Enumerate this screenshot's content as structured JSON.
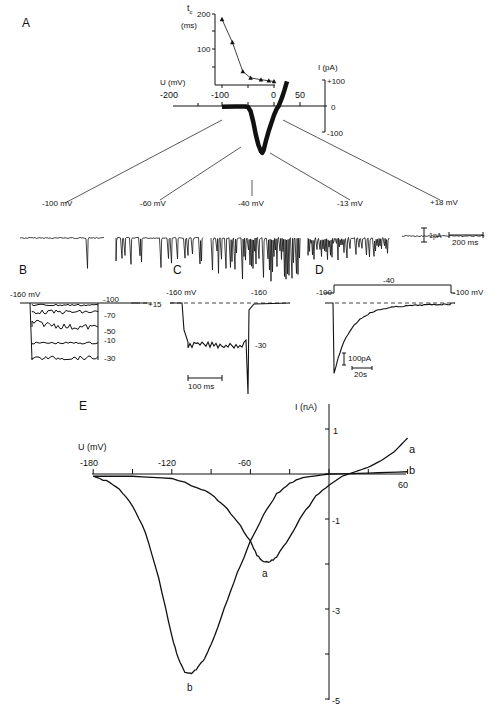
{
  "panels": {
    "A": {
      "label": "A"
    },
    "B": {
      "label": "B"
    },
    "C": {
      "label": "C"
    },
    "D": {
      "label": "D"
    },
    "E": {
      "label": "E"
    }
  },
  "chart_data": [
    {
      "id": "A-main",
      "type": "line",
      "title": "",
      "xlabel": "U (mV)",
      "ylabel": "I (pA)",
      "x_ticks": [
        "-200",
        "-100",
        "0",
        "50"
      ],
      "y_ticks": [
        "+100",
        "0",
        "-100"
      ],
      "xlim": [
        -200,
        60
      ],
      "ylim": [
        -100,
        100
      ],
      "series": [
        {
          "name": "single-channel I-V",
          "x": [
            -200,
            -150,
            -110,
            -100,
            -90,
            -80,
            -70,
            -60,
            -50,
            -45,
            -40,
            -35,
            -30,
            -20,
            -10,
            0,
            10,
            18,
            30,
            40,
            50
          ],
          "y": [
            -3,
            -2,
            -2,
            -4,
            -20,
            -60,
            -110,
            -150,
            -175,
            -180,
            -170,
            -150,
            -130,
            -95,
            -65,
            -35,
            -12,
            0,
            30,
            60,
            95
          ]
        }
      ]
    },
    {
      "id": "A-inset",
      "type": "line",
      "xlabel": "",
      "ylabel": "t_c (ms)",
      "y_ticks": [
        "200",
        "100"
      ],
      "xlim": [
        -110,
        0
      ],
      "ylim": [
        0,
        200
      ],
      "series": [
        {
          "name": "t_c",
          "x": [
            -100,
            -80,
            -60,
            -45,
            -25,
            -10,
            0
          ],
          "y": [
            185,
            120,
            38,
            20,
            15,
            12,
            10
          ]
        }
      ]
    },
    {
      "id": "A-traces",
      "type": "line",
      "traces": [
        "-100 mV",
        "-60 mV",
        "-40 mV",
        "-13 mV",
        "+18 mV"
      ],
      "scalebars": {
        "current": "1pA",
        "time": "200 ms"
      }
    },
    {
      "id": "B",
      "type": "line",
      "holding": "-160 mV",
      "trace_labels": [
        "-100",
        "-70",
        "-50",
        "-10",
        "-30",
        "+15"
      ]
    },
    {
      "id": "C",
      "type": "line",
      "labels": [
        "-160 mV",
        "-160",
        "-30"
      ],
      "scalebar": "100 ms"
    },
    {
      "id": "D",
      "type": "line",
      "protocol": [
        "-100",
        "-40",
        "-100 mV"
      ],
      "scalebars": {
        "current": "100pA",
        "time": "20s"
      }
    },
    {
      "id": "E",
      "type": "line",
      "xlabel": "U (mV)",
      "ylabel": "I (nA)",
      "x_ticks": [
        "-180",
        "-120",
        "-60",
        "60"
      ],
      "y_ticks": [
        "1",
        "-1",
        "-3",
        "-5"
      ],
      "xlim": [
        -180,
        60
      ],
      "ylim": [
        -5,
        1
      ],
      "series": [
        {
          "name": "a",
          "x": [
            -180,
            -150,
            -120,
            -100,
            -90,
            -80,
            -70,
            -60,
            -55,
            -50,
            -45,
            -40,
            -30,
            -20,
            -10,
            0,
            10,
            20,
            30,
            40,
            50,
            60
          ],
          "y": [
            -0.05,
            -0.05,
            -0.1,
            -0.3,
            -0.45,
            -0.7,
            -1.05,
            -1.5,
            -1.8,
            -1.95,
            -1.95,
            -1.85,
            -1.4,
            -0.9,
            -0.5,
            -0.25,
            -0.05,
            0.05,
            0.15,
            0.3,
            0.5,
            0.8
          ]
        },
        {
          "name": "b",
          "x": [
            -180,
            -170,
            -160,
            -150,
            -140,
            -130,
            -120,
            -115,
            -110,
            -105,
            -100,
            -95,
            -90,
            -80,
            -70,
            -60,
            -50,
            -40,
            -30,
            -20,
            0,
            30,
            60
          ],
          "y": [
            -0.05,
            -0.15,
            -0.35,
            -0.7,
            -1.3,
            -2.3,
            -3.6,
            -4.1,
            -4.4,
            -4.45,
            -4.3,
            -4.1,
            -3.8,
            -3.0,
            -2.2,
            -1.5,
            -0.9,
            -0.45,
            -0.2,
            -0.08,
            0,
            0.02,
            0.05
          ]
        }
      ]
    }
  ],
  "labels": {
    "A_tc": "t",
    "A_tc_sub": "c",
    "A_ms": "(ms)",
    "A_inset_200": "200",
    "A_inset_100": "100",
    "A_U": "U (mV)",
    "A_I": "I (pA)",
    "A_xm200": "-200",
    "A_xm100": "-100",
    "A_x0": "0",
    "A_x50": "50",
    "A_yp100": "+100",
    "A_y0": "0",
    "A_ym100": "-100",
    "tr1": "-100 mV",
    "tr2": "-60 mV",
    "tr3": "-40 mV",
    "tr4": "-13 mV",
    "tr5": "+18 mV",
    "sb_pA": "1pA",
    "sb_ms": "200 ms",
    "B_hold": "-160 mV",
    "B_m100": "-100",
    "B_p15": "+15",
    "B_m70": "-70",
    "B_m50": "-50",
    "B_m10": "-10",
    "B_m30": "-30",
    "C_hold": "-160 mV",
    "C_m160": "-160",
    "C_m30": "-30",
    "C_sb": "100 ms",
    "D_m100": "-100",
    "D_m40": "-40",
    "D_m100mV": "-100 mV",
    "D_sbpA": "100pA",
    "D_sbs": "20s",
    "E_I": "I (nA)",
    "E_U": "U (mV)",
    "E_m180": "-180",
    "E_m120": "-120",
    "E_m60": "-60",
    "E_60": "60",
    "E_1": "1",
    "E_m1": "-1",
    "E_m3": "-3",
    "E_m5": "-5",
    "E_a": "a",
    "E_b": "b",
    "E_a2": "a",
    "E_b2": "b"
  }
}
